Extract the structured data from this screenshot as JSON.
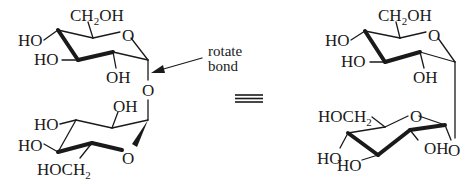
{
  "diagram": {
    "type": "chemical-structure",
    "left_structure": {
      "top_ring": {
        "substituents": [
          "CH2OH",
          "HO",
          "HO",
          "OH"
        ],
        "ring_oxygen": "O"
      },
      "glycosidic_oxygen": "O",
      "bottom_ring": {
        "substituents": [
          "OH",
          "HO",
          "HO",
          "HOCH2"
        ],
        "ring_oxygen": "O"
      },
      "annotation": {
        "line1": "rotate",
        "line2": "bond"
      }
    },
    "equivalence_symbol": "≡",
    "right_structure": {
      "top_ring": {
        "substituents": [
          "CH2OH",
          "HO",
          "HO",
          "OH"
        ],
        "ring_oxygen": "O"
      },
      "glycosidic_oxygen": "O",
      "bottom_ring": {
        "substituents": [
          "HOCH2",
          "OH",
          "HO",
          "HO"
        ],
        "ring_oxygen": "O"
      }
    }
  },
  "labels": {
    "ch2": "CH",
    "sub2": "2",
    "oh": "OH",
    "ho": "HO",
    "o": "O",
    "hoch": "HOCH",
    "rotate": "rotate",
    "bond": "bond"
  }
}
